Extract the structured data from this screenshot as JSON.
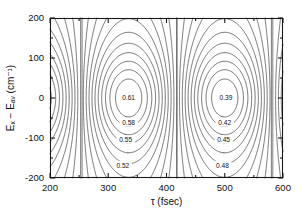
{
  "chart_data": {
    "type": "contour",
    "title": "",
    "xlabel": "τ (fsec)",
    "ylabel": "Eₓ − Eₐᵥ (cm⁻¹)",
    "xlim": [
      200,
      600
    ],
    "ylim": [
      -200,
      200
    ],
    "xticks": [
      200,
      300,
      400,
      500,
      600
    ],
    "yticks": [
      200,
      100,
      0,
      -100,
      -200
    ],
    "xticklabels": [
      "200",
      "300",
      "400",
      "500",
      "600"
    ],
    "yticklabels": [
      "200",
      "100",
      "0",
      "-100",
      "-200"
    ],
    "grid": false,
    "legend": null,
    "ticks_all_sides": true,
    "tick_direction": "in",
    "contour_color": "#2b2b2b",
    "axis_color": "#1a1a1a",
    "background": "#ffffff",
    "levels": [
      0.39,
      0.4,
      0.41,
      0.42,
      0.43,
      0.44,
      0.45,
      0.46,
      0.47,
      0.48,
      0.49,
      0.5,
      0.51,
      0.52,
      0.53,
      0.54,
      0.55,
      0.56,
      0.57,
      0.58,
      0.59,
      0.6,
      0.61
    ],
    "labeled_levels": [
      {
        "value": 0.61,
        "text": "0.61",
        "x": 335,
        "y": 0
      },
      {
        "value": 0.58,
        "text": "0.58",
        "x": 335,
        "y": -62
      },
      {
        "value": 0.55,
        "text": "0.55",
        "x": 330,
        "y": -105
      },
      {
        "value": 0.52,
        "text": "0.52",
        "x": 325,
        "y": -168
      },
      {
        "value": 0.39,
        "text": "0.39",
        "x": 502,
        "y": 0
      },
      {
        "value": 0.42,
        "text": "0.42",
        "x": 500,
        "y": -62
      },
      {
        "value": 0.45,
        "text": "0.45",
        "x": 498,
        "y": -105
      },
      {
        "value": 0.48,
        "text": "0.48",
        "x": 496,
        "y": -168
      }
    ],
    "extrema": [
      {
        "kind": "maximum",
        "value": 0.61,
        "x": 335,
        "y": 0
      },
      {
        "kind": "minimum",
        "value": 0.39,
        "x": 500,
        "y": 0
      },
      {
        "kind": "maximum",
        "value": 0.61,
        "x": 170,
        "y": 0
      }
    ],
    "separatrices_x": [
      255,
      418,
      580
    ],
    "field": {
      "model": "A + B*cos(2*pi*(x - x0)/period)*envelope(y)",
      "A": 0.5,
      "B": 0.11,
      "x0": 335,
      "period": 330,
      "envelope": "1/(1+(y/yw)^2)",
      "yw": 150
    }
  },
  "axes": {
    "x_label": "τ (fsec)",
    "y_label": "Eₓ − Eₐᵥ (cm⁻¹)"
  }
}
